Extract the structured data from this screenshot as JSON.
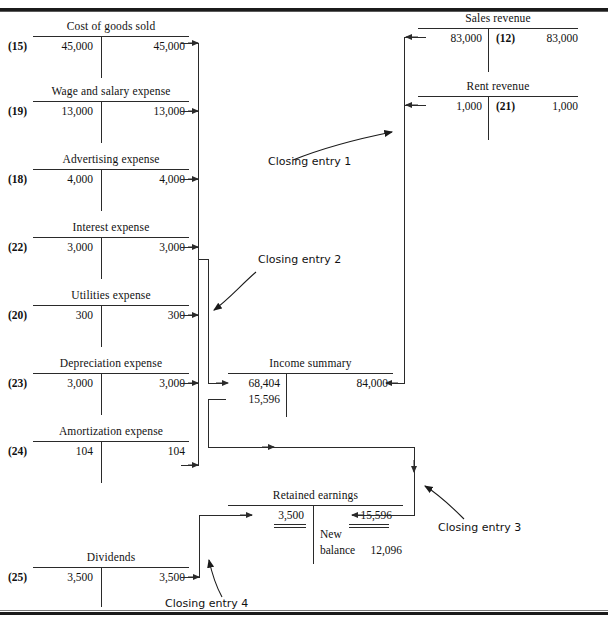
{
  "figure": {
    "title": "",
    "type": "t-account-closing-entries-diagram"
  },
  "accounts": [
    {
      "id": "cost-of-goods-sold",
      "title": "Cost of goods sold",
      "debit_ref": "(15)",
      "debit_amount": "45,000",
      "credit_amount": "45,000"
    },
    {
      "id": "wage-and-salary-expense",
      "title": "Wage and salary expense",
      "debit_ref": "(19)",
      "debit_amount": "13,000",
      "credit_amount": "13,000"
    },
    {
      "id": "advertising-expense",
      "title": "Advertising expense",
      "debit_ref": "(18)",
      "debit_amount": "4,000",
      "credit_amount": "4,000"
    },
    {
      "id": "interest-expense",
      "title": "Interest expense",
      "debit_ref": "(22)",
      "debit_amount": "3,000",
      "credit_amount": "3,000"
    },
    {
      "id": "utilities-expense",
      "title": "Utilities expense",
      "debit_ref": "(20)",
      "debit_amount": "300",
      "credit_amount": "300"
    },
    {
      "id": "depreciation-expense",
      "title": "Depreciation expense",
      "debit_ref": "(23)",
      "debit_amount": "3,000",
      "credit_amount": "3,000"
    },
    {
      "id": "amortization-expense",
      "title": "Amortization expense",
      "debit_ref": "(24)",
      "debit_amount": "104",
      "credit_amount": "104"
    },
    {
      "id": "dividends",
      "title": "Dividends",
      "debit_ref": "(25)",
      "debit_amount": "3,500",
      "credit_amount": "3,500"
    },
    {
      "id": "sales-revenue",
      "title": "Sales revenue",
      "debit_amount": "83,000",
      "credit_ref": "(12)",
      "credit_amount": "83,000"
    },
    {
      "id": "rent-revenue",
      "title": "Rent revenue",
      "debit_amount": "1,000",
      "credit_ref": "(21)",
      "credit_amount": "1,000"
    }
  ],
  "income_summary": {
    "title": "Income summary",
    "debit_line_1": "68,404",
    "debit_line_2": "15,596",
    "credit_line_1": "84,000"
  },
  "retained_earnings": {
    "title": "Retained earnings",
    "debit_amount": "3,500",
    "credit_amount": "15,596",
    "new_balance_label_line1": "New",
    "new_balance_label_line2": "balance",
    "new_balance_amount": "12,096"
  },
  "annotations": {
    "closing_entry_1": "Closing entry 1",
    "closing_entry_2": "Closing entry 2",
    "closing_entry_3": "Closing entry 3",
    "closing_entry_4": "Closing entry 4"
  },
  "colors": {
    "ink": "#2a2a2a",
    "rule": "#1b1b1b",
    "background": "#ffffff"
  }
}
